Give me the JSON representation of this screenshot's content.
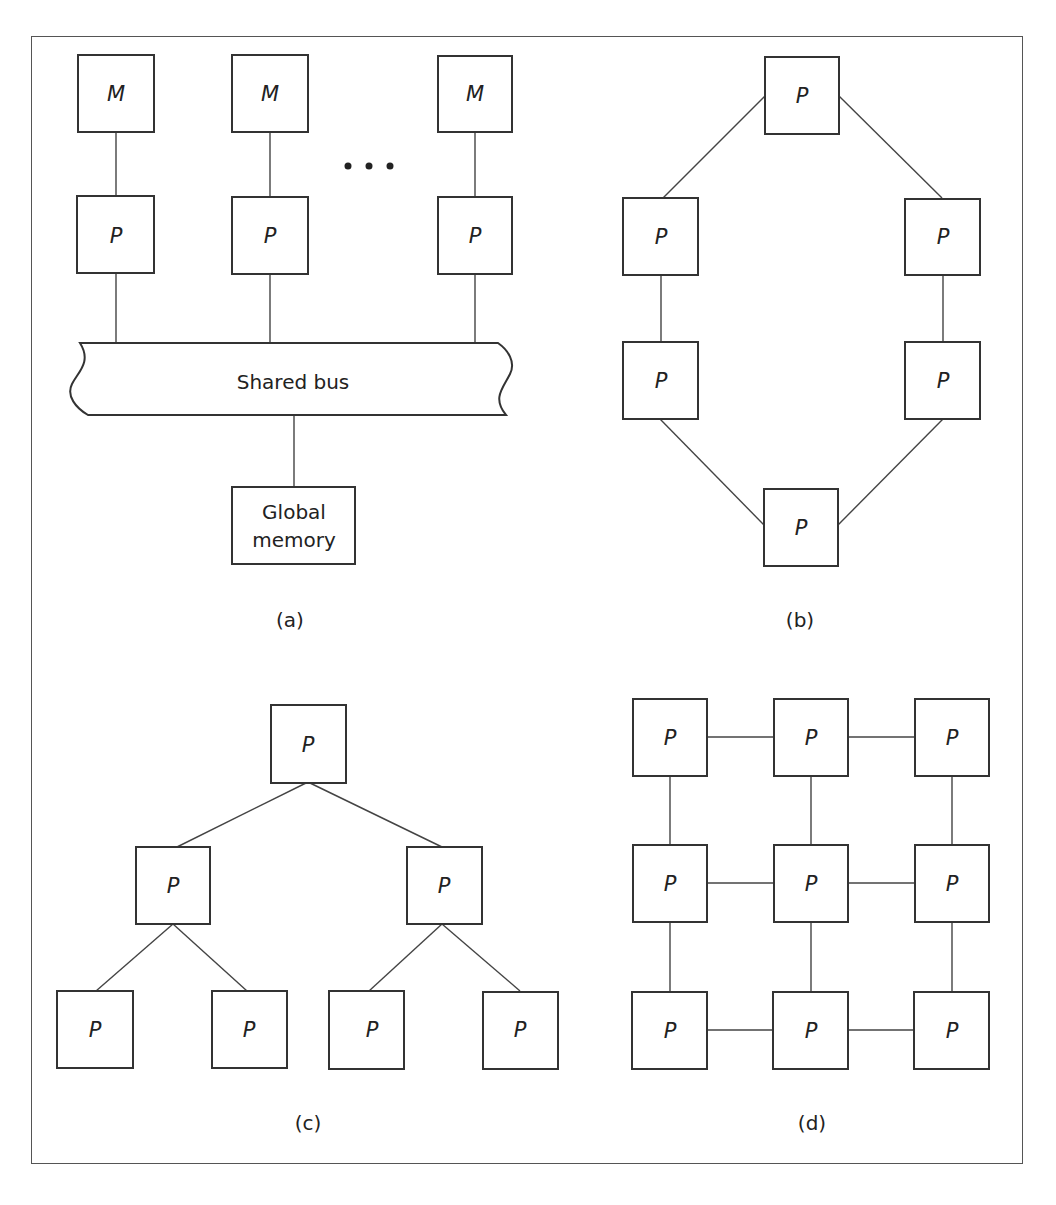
{
  "figure": {
    "panels": [
      {
        "id": "a",
        "caption": "(a)",
        "title": "Shared-bus multiprocessor",
        "memory_label": "M",
        "processor_label": "P",
        "bus_label": "Shared bus",
        "global_memory_label_line1": "Global",
        "global_memory_label_line2": "memory",
        "ellipsis": "• • •"
      },
      {
        "id": "b",
        "caption": "(b)",
        "topology": "ring",
        "node_label": "P",
        "node_count": 6
      },
      {
        "id": "c",
        "caption": "(c)",
        "topology": "binary tree",
        "node_label": "P",
        "node_count": 7
      },
      {
        "id": "d",
        "caption": "(d)",
        "topology": "mesh 3x3",
        "node_label": "P",
        "node_count": 9
      }
    ]
  },
  "labels": {
    "M": "M",
    "P": "P",
    "shared_bus": "Shared bus",
    "global": "Global",
    "memory": "memory",
    "cap_a": "(a)",
    "cap_b": "(b)",
    "cap_c": "(c)",
    "cap_d": "(d)"
  },
  "colors": {
    "stroke": "#333333",
    "frame": "#555555",
    "background": "#ffffff",
    "text": "#222222"
  }
}
